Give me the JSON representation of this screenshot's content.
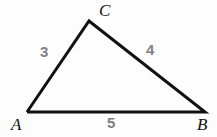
{
  "figure": {
    "type": "triangle-diagram",
    "background_color": "#fdfdfd",
    "stroke_color": "#111111",
    "vertex_label_color": "#111111",
    "side_label_color": "#808082",
    "canvas": {
      "width": 217,
      "height": 137
    },
    "vertices": [
      {
        "name": "A",
        "label": "A",
        "x": 27,
        "y": 112
      },
      {
        "name": "B",
        "label": "B",
        "x": 205,
        "y": 112
      },
      {
        "name": "C",
        "label": "C",
        "x": 89,
        "y": 21
      }
    ],
    "sides": [
      {
        "name": "AC",
        "label": "3",
        "from": "A",
        "to": "C"
      },
      {
        "name": "CB",
        "label": "4",
        "from": "C",
        "to": "B"
      },
      {
        "name": "AB",
        "label": "5",
        "from": "A",
        "to": "B"
      }
    ],
    "path": "M 27,112 L 89,21 L 205,112 Z",
    "stroke_width": 3
  }
}
